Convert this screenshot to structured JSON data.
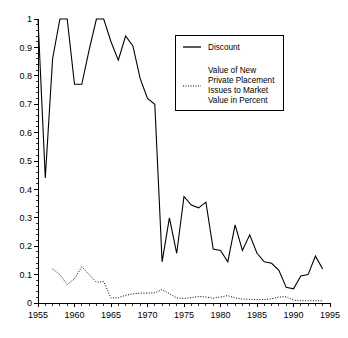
{
  "chart_data": {
    "type": "line",
    "title": "",
    "subtitle": "",
    "xlabel": "",
    "ylabel": "",
    "xlim": [
      1955,
      1995
    ],
    "ylim": [
      0,
      1
    ],
    "grid": false,
    "legend_position": "top-right",
    "x_ticks": [
      1955,
      1960,
      1965,
      1970,
      1975,
      1980,
      1985,
      1990,
      1995
    ],
    "x_tick_labels": [
      "1955",
      "1960",
      "1965",
      "1970",
      "1975",
      "1980",
      "1985",
      "1990",
      "1995"
    ],
    "x_minor_tick_step": 1,
    "y_ticks": [
      0,
      0.1,
      0.2,
      0.3,
      0.4,
      0.5,
      0.6,
      0.7,
      0.8,
      0.9,
      1
    ],
    "y_tick_labels": [
      "0",
      "0.1",
      "0.2",
      "0.3",
      "0.4",
      "0.5",
      "0.6",
      "0.7",
      "0.8",
      "0.9",
      "1"
    ],
    "series": [
      {
        "name": "Discount",
        "style": "solid",
        "color": "#000000",
        "x": [
          1955,
          1956,
          1957,
          1958,
          1959,
          1960,
          1961,
          1962,
          1963,
          1964,
          1965,
          1966,
          1967,
          1968,
          1969,
          1970,
          1971,
          1972,
          1973,
          1974,
          1975,
          1976,
          1977,
          1978,
          1979,
          1980,
          1981,
          1982,
          1983,
          1984,
          1985,
          1986,
          1987,
          1988,
          1989,
          1990,
          1991,
          1992,
          1993,
          1994
        ],
        "values": [
          1.0,
          0.44,
          0.86,
          1.0,
          1.0,
          0.77,
          0.77,
          0.89,
          1.0,
          1.0,
          0.92,
          0.855,
          0.94,
          0.905,
          0.79,
          0.72,
          0.7,
          0.145,
          0.3,
          0.175,
          0.375,
          0.345,
          0.335,
          0.355,
          0.19,
          0.185,
          0.145,
          0.275,
          0.185,
          0.24,
          0.175,
          0.145,
          0.14,
          0.115,
          0.055,
          0.05,
          0.095,
          0.1,
          0.165,
          0.12
        ]
      },
      {
        "name": "Value of New Private Placement Issues to Market Value in Percent",
        "style": "dotted",
        "color": "#000000",
        "x": [
          1957,
          1958,
          1959,
          1960,
          1961,
          1962,
          1963,
          1964,
          1965,
          1966,
          1967,
          1968,
          1969,
          1970,
          1971,
          1972,
          1973,
          1974,
          1975,
          1976,
          1977,
          1978,
          1979,
          1980,
          1981,
          1982,
          1983,
          1984,
          1985,
          1986,
          1987,
          1988,
          1989,
          1990,
          1991,
          1992,
          1993,
          1994
        ],
        "values": [
          0.12,
          0.1,
          0.065,
          0.085,
          0.128,
          0.1,
          0.073,
          0.075,
          0.017,
          0.019,
          0.027,
          0.032,
          0.035,
          0.035,
          0.036,
          0.047,
          0.033,
          0.018,
          0.016,
          0.019,
          0.023,
          0.021,
          0.017,
          0.021,
          0.026,
          0.018,
          0.014,
          0.013,
          0.012,
          0.012,
          0.015,
          0.021,
          0.022,
          0.01,
          0.008,
          0.008,
          0.008,
          0.008
        ]
      }
    ]
  },
  "legend": {
    "entry_solid": {
      "label": "Discount",
      "sample": "solid-line-sample"
    },
    "entry_dotted": {
      "lines": [
        "Value of New",
        "Private Placement",
        "Issues to Market",
        "Value in Percent"
      ],
      "sample": "dotted-line-sample"
    }
  }
}
